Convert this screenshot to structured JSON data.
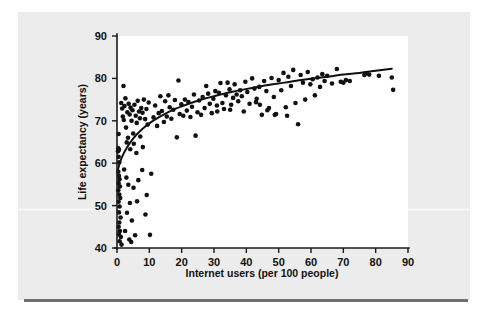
{
  "figure": {
    "background_color": "#ececec",
    "plot_background_color": "#ffffff",
    "ink_color": "#111111"
  },
  "chart_data": {
    "type": "scatter",
    "title": "",
    "subtitle": "",
    "xlabel": "Internet users (per 100 people)",
    "ylabel": "Life expectancy (years)",
    "xlim": [
      0,
      90
    ],
    "ylim": [
      40,
      90
    ],
    "xticks": [
      0,
      10,
      20,
      30,
      40,
      50,
      60,
      70,
      80,
      90
    ],
    "yticks": [
      40,
      50,
      60,
      70,
      80,
      90
    ],
    "xticklabels": [
      "0",
      "10",
      "20",
      "30",
      "40",
      "50",
      "60",
      "70",
      "80",
      "90"
    ],
    "yticklabels": [
      "40",
      "50",
      "60",
      "70",
      "80",
      "90"
    ],
    "grid": false,
    "legend": null,
    "legend_position": "none",
    "marker": "filled-circle",
    "marker_size_px": 2.3,
    "series": [
      {
        "name": "countries",
        "points": [
          [
            0.3,
            62.8
          ],
          [
            0.4,
            63.5
          ],
          [
            0.5,
            61.5
          ],
          [
            0.6,
            63.2
          ],
          [
            0.5,
            66.9
          ],
          [
            0.7,
            60.2
          ],
          [
            0.4,
            58.0
          ],
          [
            0.6,
            57.0
          ],
          [
            0.8,
            56.2
          ],
          [
            0.5,
            55.3
          ],
          [
            0.9,
            54.5
          ],
          [
            0.4,
            53.6
          ],
          [
            0.7,
            52.6
          ],
          [
            1.0,
            51.8
          ],
          [
            0.5,
            50.9
          ],
          [
            0.8,
            49.8
          ],
          [
            0.6,
            48.4
          ],
          [
            1.1,
            47.2
          ],
          [
            0.7,
            46.0
          ],
          [
            0.5,
            45.0
          ],
          [
            0.9,
            44.0
          ],
          [
            0.6,
            43.2
          ],
          [
            1.2,
            42.6
          ],
          [
            0.8,
            41.6
          ],
          [
            1.4,
            40.8
          ],
          [
            1.6,
            72.9
          ],
          [
            1.3,
            74.2
          ],
          [
            2.0,
            78.2
          ],
          [
            1.8,
            71.0
          ],
          [
            2.3,
            73.5
          ],
          [
            2.6,
            75.3
          ],
          [
            2.1,
            70.2
          ],
          [
            2.8,
            68.4
          ],
          [
            3.2,
            72.0
          ],
          [
            3.0,
            64.9
          ],
          [
            3.6,
            74.0
          ],
          [
            3.4,
            66.0
          ],
          [
            3.9,
            71.5
          ],
          [
            4.2,
            73.1
          ],
          [
            4.5,
            70.0
          ],
          [
            4.1,
            63.3
          ],
          [
            4.8,
            72.5
          ],
          [
            5.0,
            67.0
          ],
          [
            5.4,
            73.8
          ],
          [
            5.2,
            64.6
          ],
          [
            5.8,
            71.2
          ],
          [
            6.1,
            69.5
          ],
          [
            6.4,
            74.7
          ],
          [
            6.0,
            62.4
          ],
          [
            6.8,
            72.2
          ],
          [
            7.1,
            70.6
          ],
          [
            7.5,
            73.0
          ],
          [
            7.2,
            66.3
          ],
          [
            7.9,
            71.9
          ],
          [
            8.3,
            75.0
          ],
          [
            8.0,
            63.8
          ],
          [
            8.7,
            70.4
          ],
          [
            9.1,
            72.8
          ],
          [
            9.5,
            69.1
          ],
          [
            9.8,
            74.3
          ],
          [
            2.2,
            58.5
          ],
          [
            2.9,
            56.6
          ],
          [
            3.5,
            54.9
          ],
          [
            4.0,
            50.6
          ],
          [
            3.1,
            48.3
          ],
          [
            4.6,
            46.5
          ],
          [
            2.5,
            44.0
          ],
          [
            3.8,
            42.0
          ],
          [
            4.4,
            41.4
          ],
          [
            5.6,
            43.0
          ],
          [
            5.1,
            54.2
          ],
          [
            6.6,
            56.0
          ],
          [
            7.8,
            58.4
          ],
          [
            6.2,
            51.0
          ],
          [
            8.8,
            47.9
          ],
          [
            10.2,
            43.1
          ],
          [
            9.2,
            52.5
          ],
          [
            10.6,
            57.5
          ],
          [
            11.3,
            70.8
          ],
          [
            11.8,
            73.6
          ],
          [
            12.4,
            68.8
          ],
          [
            12.9,
            71.8
          ],
          [
            13.4,
            75.8
          ],
          [
            13.9,
            72.3
          ],
          [
            14.5,
            69.7
          ],
          [
            14.9,
            74.6
          ],
          [
            15.4,
            71.0
          ],
          [
            15.9,
            76.0
          ],
          [
            16.3,
            73.2
          ],
          [
            16.8,
            70.5
          ],
          [
            17.4,
            72.6
          ],
          [
            17.9,
            74.9
          ],
          [
            18.5,
            66.1
          ],
          [
            19.0,
            79.5
          ],
          [
            19.4,
            71.6
          ],
          [
            19.9,
            73.9
          ],
          [
            20.5,
            71.2
          ],
          [
            21.0,
            75.0
          ],
          [
            21.6,
            72.4
          ],
          [
            22.1,
            74.4
          ],
          [
            22.7,
            70.9
          ],
          [
            23.2,
            73.3
          ],
          [
            23.8,
            76.2
          ],
          [
            24.3,
            66.5
          ],
          [
            24.9,
            72.0
          ],
          [
            25.4,
            74.8
          ],
          [
            26.0,
            71.4
          ],
          [
            26.5,
            75.6
          ],
          [
            27.1,
            73.0
          ],
          [
            27.6,
            78.2
          ],
          [
            28.2,
            76.4
          ],
          [
            28.7,
            74.0
          ],
          [
            29.3,
            71.8
          ],
          [
            29.8,
            75.2
          ],
          [
            30.4,
            77.0
          ],
          [
            30.9,
            73.6
          ],
          [
            31.5,
            76.6
          ],
          [
            32.0,
            78.9
          ],
          [
            32.6,
            74.2
          ],
          [
            33.1,
            72.8
          ],
          [
            33.7,
            76.0
          ],
          [
            34.2,
            79.0
          ],
          [
            34.8,
            77.4
          ],
          [
            35.3,
            73.8
          ],
          [
            35.9,
            75.4
          ],
          [
            36.4,
            78.6
          ],
          [
            37.0,
            76.2
          ],
          [
            37.5,
            74.6
          ],
          [
            38.1,
            77.2
          ],
          [
            38.6,
            75.8
          ],
          [
            39.2,
            72.2
          ],
          [
            39.7,
            79.2
          ],
          [
            40.3,
            76.8
          ],
          [
            41.0,
            74.0
          ],
          [
            41.8,
            80.0
          ],
          [
            42.5,
            77.6
          ],
          [
            43.2,
            75.2
          ],
          [
            44.0,
            78.0
          ],
          [
            44.8,
            71.4
          ],
          [
            45.5,
            79.4
          ],
          [
            46.2,
            77.0
          ],
          [
            47.0,
            73.0
          ],
          [
            47.8,
            80.1
          ],
          [
            48.5,
            75.6
          ],
          [
            49.2,
            71.6
          ],
          [
            50.0,
            79.6
          ],
          [
            50.8,
            77.2
          ],
          [
            51.5,
            81.3
          ],
          [
            52.2,
            73.2
          ],
          [
            53.0,
            80.4
          ],
          [
            53.8,
            78.2
          ],
          [
            54.5,
            82.0
          ],
          [
            55.2,
            74.2
          ],
          [
            56.0,
            69.2
          ],
          [
            56.8,
            80.8
          ],
          [
            57.5,
            79.0
          ],
          [
            58.2,
            75.0
          ],
          [
            59.0,
            81.5
          ],
          [
            59.8,
            78.6
          ],
          [
            60.5,
            79.8
          ],
          [
            61.2,
            76.0
          ],
          [
            62.0,
            80.2
          ],
          [
            62.8,
            78.0
          ],
          [
            63.5,
            81.0
          ],
          [
            64.2,
            79.4
          ],
          [
            65.0,
            80.6
          ],
          [
            66.5,
            78.8
          ],
          [
            68.0,
            82.2
          ],
          [
            69.2,
            79.2
          ],
          [
            70.0,
            79.0
          ],
          [
            70.8,
            79.6
          ],
          [
            72.0,
            79.4
          ],
          [
            76.5,
            80.8
          ],
          [
            77.2,
            81.2
          ],
          [
            78.0,
            80.9
          ],
          [
            81.0,
            80.6
          ],
          [
            85.0,
            80.2
          ],
          [
            85.4,
            77.3
          ],
          [
            52.6,
            71.2
          ],
          [
            48.8,
            71.4
          ],
          [
            46.5,
            72.5
          ],
          [
            44.2,
            73.8
          ],
          [
            43.0,
            74.4
          ],
          [
            35.0,
            72.6
          ],
          [
            31.0,
            72.2
          ]
        ]
      }
    ],
    "trend_curve": {
      "name": "fitted-logarithmic-trend",
      "points": [
        [
          0.3,
          58.5
        ],
        [
          1.0,
          60.4
        ],
        [
          2.0,
          62.2
        ],
        [
          3.0,
          63.6
        ],
        [
          4.0,
          64.8
        ],
        [
          5.0,
          65.8
        ],
        [
          6.0,
          66.7
        ],
        [
          8.0,
          68.2
        ],
        [
          10.0,
          69.4
        ],
        [
          12.0,
          70.4
        ],
        [
          14.0,
          71.3
        ],
        [
          16.0,
          72.1
        ],
        [
          18.0,
          72.8
        ],
        [
          20.0,
          73.4
        ],
        [
          24.0,
          74.5
        ],
        [
          28.0,
          75.4
        ],
        [
          32.0,
          76.2
        ],
        [
          36.0,
          76.9
        ],
        [
          40.0,
          77.5
        ],
        [
          45.0,
          78.2
        ],
        [
          50.0,
          78.8
        ],
        [
          55.0,
          79.4
        ],
        [
          60.0,
          79.9
        ],
        [
          65.0,
          80.4
        ],
        [
          70.0,
          80.9
        ],
        [
          75.0,
          81.3
        ],
        [
          80.0,
          81.8
        ],
        [
          85.0,
          82.3
        ]
      ]
    }
  }
}
